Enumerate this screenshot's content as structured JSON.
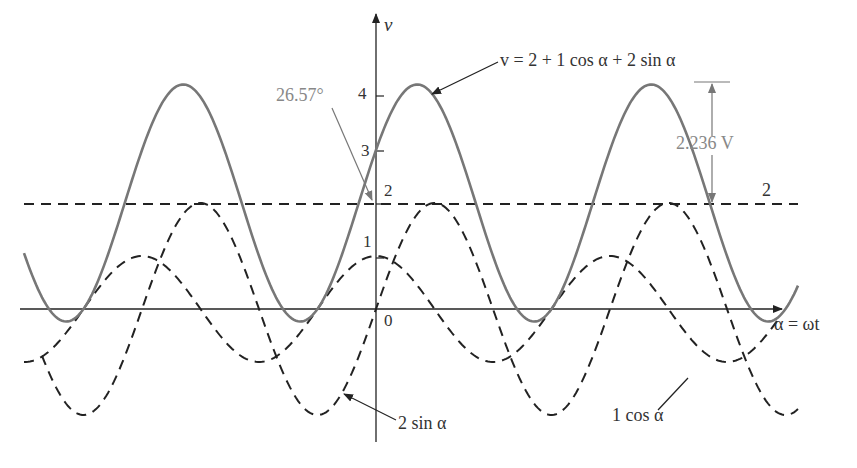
{
  "chart_data": {
    "type": "line",
    "title": "",
    "xlabel": "α = ωt",
    "ylabel": "v",
    "y_ticks": [
      "0",
      "1",
      "2",
      "3",
      "4"
    ],
    "ylim": [
      -2.2,
      5.2
    ],
    "grid": false,
    "x_unit": "degrees (α)",
    "series": [
      {
        "name": "v = 2 + 1 cos α + 2 sin α",
        "style": "solid gray",
        "expression": "2 + cos(a) + 2*sin(a)",
        "peak": 4.236,
        "min": -0.236
      },
      {
        "name": "2",
        "style": "dashed",
        "expression": "2",
        "value": 2
      },
      {
        "name": "1 cos α",
        "style": "dashed",
        "expression": "cos(a)",
        "amplitude": 1
      },
      {
        "name": "2 sin α",
        "style": "dashed",
        "expression": "2*sin(a)",
        "amplitude": 2
      }
    ],
    "annotations": [
      {
        "text": "26.57°",
        "meaning": "phase lead of the sum waveform"
      },
      {
        "text": "2.236 V",
        "meaning": "amplitude of the sinusoidal part above the dc level 2"
      },
      {
        "text": "2",
        "meaning": "dc level label"
      },
      {
        "text": "0",
        "meaning": "origin"
      }
    ]
  },
  "labels": {
    "y_axis": "v",
    "x_axis": "α = ωt",
    "sum_eq": "v = 2 + 1 cos α + 2 sin α",
    "phase": "26.57°",
    "amplitude": "2.236 V",
    "dc": "2",
    "cos_label": "1 cos α",
    "sin_label": "2 sin α",
    "origin": "0",
    "tick1": "1",
    "tick2": "2",
    "tick3": "3",
    "tick4": "4"
  }
}
